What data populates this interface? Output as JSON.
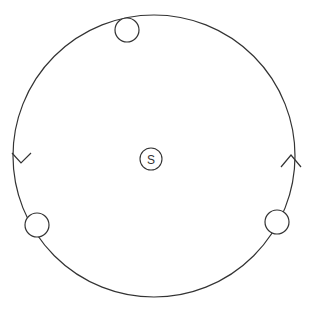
{
  "diagram": {
    "title": "",
    "orbit": {
      "cx": 154,
      "cy": 156,
      "r": 141,
      "stroke": "#333333"
    },
    "center_body": {
      "label": "S",
      "cx": 151,
      "cy": 159,
      "r": 11
    },
    "bodies": [
      {
        "name": "top",
        "cx": 127,
        "cy": 30,
        "r": 12
      },
      {
        "name": "lower-left",
        "cx": 37,
        "cy": 225,
        "r": 12
      },
      {
        "name": "lower-right",
        "cx": 277,
        "cy": 222,
        "r": 12
      }
    ],
    "arrows": [
      {
        "name": "left",
        "direction": "down",
        "x": 22,
        "y": 163
      },
      {
        "name": "right",
        "direction": "up",
        "x": 291,
        "y": 157
      }
    ]
  }
}
